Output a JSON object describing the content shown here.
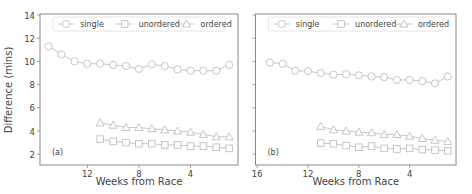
{
  "figure": {
    "ylabel": "Difference (mins)",
    "colors": {
      "frame": "#8a8a8a",
      "series": "#b8b8b8",
      "text": "#444444",
      "legend_border": "#dddddd"
    }
  },
  "chart_data": [
    {
      "type": "line",
      "panel_label": "(a)",
      "xlabel": "Weeks from Race",
      "ylabel": "Difference (mins)",
      "xlim": [
        15.6,
        0.6
      ],
      "ylim": [
        1,
        14
      ],
      "xticks": [
        12,
        8,
        4
      ],
      "yticks": [
        2,
        4,
        6,
        8,
        10,
        12,
        14
      ],
      "grid": false,
      "legend_position": "top",
      "legend": [
        "single",
        "unordered",
        "ordered"
      ],
      "series": [
        {
          "name": "single",
          "marker": "circle",
          "x": [
            15,
            14,
            13,
            12,
            11,
            10,
            9,
            8,
            7,
            6,
            5,
            4,
            3,
            2,
            1
          ],
          "values": [
            11.3,
            10.6,
            10.0,
            9.8,
            9.8,
            9.7,
            9.6,
            9.35,
            9.75,
            9.6,
            9.3,
            9.2,
            9.2,
            9.2,
            9.7
          ]
        },
        {
          "name": "unordered",
          "marker": "square",
          "x": [
            11,
            10,
            9,
            8,
            7,
            6,
            5,
            4,
            3,
            2,
            1
          ],
          "values": [
            3.3,
            3.1,
            3.0,
            2.9,
            2.9,
            2.8,
            2.8,
            2.7,
            2.7,
            2.6,
            2.5
          ]
        },
        {
          "name": "ordered",
          "marker": "triangle",
          "x": [
            11,
            10,
            9,
            8,
            7,
            6,
            5,
            4,
            3,
            2,
            1
          ],
          "values": [
            4.7,
            4.5,
            4.3,
            4.3,
            4.2,
            4.1,
            4.0,
            3.9,
            3.7,
            3.5,
            3.5
          ]
        }
      ]
    },
    {
      "type": "line",
      "panel_label": "(b)",
      "xlabel": "Weeks from Race",
      "ylabel": "",
      "xlim": [
        16,
        0.5
      ],
      "ylim": [
        1,
        14
      ],
      "xticks": [
        16,
        12,
        8,
        4
      ],
      "yticks": [
        2,
        4,
        6,
        8,
        10,
        12,
        14
      ],
      "grid": false,
      "legend_position": "top",
      "legend": [
        "single",
        "unordered",
        "ordered"
      ],
      "series": [
        {
          "name": "single",
          "marker": "circle",
          "x": [
            15,
            14,
            13,
            12,
            11,
            10,
            9,
            8,
            7,
            6,
            5,
            4,
            3,
            2,
            1
          ],
          "values": [
            9.9,
            9.8,
            9.2,
            9.15,
            9.0,
            8.85,
            8.9,
            8.8,
            8.7,
            8.65,
            8.4,
            8.4,
            8.3,
            8.1,
            8.7
          ]
        },
        {
          "name": "unordered",
          "marker": "square",
          "x": [
            11,
            10,
            9,
            8,
            7,
            6,
            5,
            4,
            3,
            2,
            1
          ],
          "values": [
            2.95,
            2.9,
            2.75,
            2.6,
            2.7,
            2.5,
            2.45,
            2.5,
            2.4,
            2.35,
            2.3
          ]
        },
        {
          "name": "ordered",
          "marker": "triangle",
          "x": [
            11,
            10,
            9,
            8,
            7,
            6,
            5,
            4,
            3,
            2,
            1
          ],
          "values": [
            4.4,
            4.1,
            4.0,
            3.9,
            3.85,
            3.7,
            3.7,
            3.55,
            3.35,
            3.2,
            3.1
          ]
        }
      ]
    }
  ]
}
